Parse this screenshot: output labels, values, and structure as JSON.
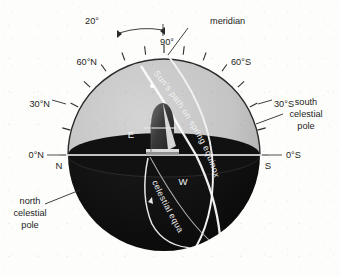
{
  "figure": {
    "background_color": "#fdfdfb",
    "upper_hemisphere_color": "#c4c4c4",
    "lower_hemisphere_color": "#121212",
    "line_color": "#f2f2f2",
    "text_color": "#1d1d1d"
  },
  "sphere": {
    "center_x": 164,
    "center_y": 155,
    "radius": 96,
    "horizon_y": 155
  },
  "labels": {
    "meridian": "meridian",
    "angle_20": "20°",
    "angle_90": "90°",
    "lat_60n": "60°N",
    "lat_30n": "30°N",
    "lat_0n": "0°N",
    "lat_60s": "60°S",
    "lat_30s": "30°S",
    "lat_0s": "0°S",
    "south_pole_line1": "south",
    "south_pole_line2": "celestial",
    "south_pole_line3": "pole",
    "north_pole_line1": "north",
    "north_pole_line2": "celestial",
    "north_pole_line3": "pole",
    "cardinal_n": "N",
    "cardinal_s": "S",
    "cardinal_e": "E",
    "cardinal_w": "W",
    "sun_path": "Sun's path on spring equinox",
    "celestial_equator": "celestial equator"
  },
  "ticks": {
    "upper_rim_count": 13,
    "label_degrees": [
      0,
      30,
      60,
      90,
      60,
      30,
      0
    ]
  }
}
